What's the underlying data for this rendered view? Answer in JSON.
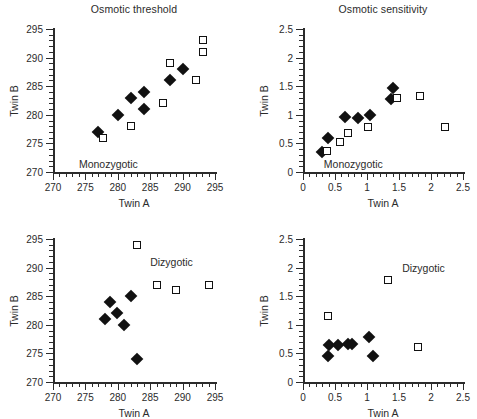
{
  "figure": {
    "panels": [
      {
        "id": "top-left",
        "title": "Osmotic threshold",
        "group_label": "Monozygotic",
        "xlabel": "Twin A",
        "ylabel": "Twin B",
        "xlim": [
          270,
          295
        ],
        "ylim": [
          270,
          295
        ],
        "xticks": [
          270,
          275,
          280,
          285,
          290,
          295
        ],
        "yticks": [
          270,
          275,
          280,
          285,
          290,
          295
        ],
        "xticklabels": [
          "270",
          "275",
          "280",
          "285",
          "290",
          "295"
        ],
        "yticklabels": [
          "270",
          "275",
          "280",
          "285",
          "290",
          "295"
        ],
        "minor_step": 1,
        "series": [
          {
            "name": "filled-diamond",
            "marker": "filled-diamond",
            "points": [
              [
                277.0,
                277.0
              ],
              [
                280.0,
                280.0
              ],
              [
                282.0,
                283.0
              ],
              [
                284.0,
                284.0
              ],
              [
                284.0,
                281.0
              ],
              [
                288.0,
                286.0
              ],
              [
                290.0,
                288.0
              ]
            ]
          },
          {
            "name": "open-square",
            "marker": "open-square",
            "points": [
              [
                277.7,
                276.0
              ],
              [
                282.0,
                278.0
              ],
              [
                287.0,
                282.0
              ],
              [
                288.0,
                289.0
              ],
              [
                292.0,
                286.0
              ],
              [
                293.2,
                291.0
              ],
              [
                293.2,
                293.0
              ]
            ]
          }
        ]
      },
      {
        "id": "top-right",
        "title": "Osmotic sensitivity",
        "group_label": "Monozygotic",
        "xlabel": "Twin A",
        "ylabel": "Twin B",
        "xlim": [
          0,
          2.5
        ],
        "ylim": [
          0,
          2.5
        ],
        "xticks": [
          0,
          0.5,
          1,
          1.5,
          2,
          2.5
        ],
        "yticks": [
          0,
          0.5,
          1,
          1.5,
          2,
          2.5
        ],
        "xticklabels": [
          "0",
          "0.5",
          "1",
          "1.5",
          "2",
          "2.5"
        ],
        "yticklabels": [
          "0",
          "0.5",
          "1",
          "1.5",
          "2",
          "2.5"
        ],
        "minor_step": 0.1,
        "series": [
          {
            "name": "filled-diamond",
            "marker": "filled-diamond",
            "points": [
              [
                0.29,
                0.35
              ],
              [
                0.39,
                0.6
              ],
              [
                0.66,
                0.97
              ],
              [
                0.86,
                0.95
              ],
              [
                1.05,
                1.0
              ],
              [
                1.37,
                1.28
              ],
              [
                1.4,
                1.47
              ]
            ]
          },
          {
            "name": "open-square",
            "marker": "open-square",
            "points": [
              [
                0.38,
                0.36
              ],
              [
                0.58,
                0.52
              ],
              [
                0.7,
                0.68
              ],
              [
                1.02,
                0.78
              ],
              [
                1.47,
                1.29
              ],
              [
                1.83,
                1.33
              ],
              [
                2.22,
                0.78
              ]
            ]
          }
        ]
      },
      {
        "id": "bottom-left",
        "title": "",
        "group_label": "Dizygotic",
        "xlabel": "Twin A",
        "ylabel": "Twin B",
        "xlim": [
          270,
          295
        ],
        "ylim": [
          270,
          295
        ],
        "xticks": [
          270,
          275,
          280,
          285,
          290,
          295
        ],
        "yticks": [
          270,
          275,
          280,
          285,
          290,
          295
        ],
        "xticklabels": [
          "270",
          "275",
          "280",
          "285",
          "290",
          "295"
        ],
        "yticklabels": [
          "270",
          "275",
          "280",
          "285",
          "290",
          "295"
        ],
        "minor_step": 1,
        "series": [
          {
            "name": "filled-diamond",
            "marker": "filled-diamond",
            "points": [
              [
                278.0,
                281.0
              ],
              [
                278.8,
                284.0
              ],
              [
                279.8,
                282.0
              ],
              [
                281.0,
                280.0
              ],
              [
                282.0,
                285.0
              ],
              [
                283.0,
                274.0
              ]
            ]
          },
          {
            "name": "open-square",
            "marker": "open-square",
            "points": [
              [
                283.0,
                294.0
              ],
              [
                286.0,
                287.0
              ],
              [
                289.0,
                286.0
              ],
              [
                294.0,
                287.0
              ]
            ]
          }
        ]
      },
      {
        "id": "bottom-right",
        "title": "",
        "group_label": "Dizygotic",
        "xlabel": "Twin A",
        "ylabel": "Twin B",
        "xlim": [
          0,
          2.5
        ],
        "ylim": [
          0,
          2.5
        ],
        "xticks": [
          0,
          0.5,
          1,
          1.5,
          2,
          2.5
        ],
        "yticks": [
          0,
          0.5,
          1,
          1.5,
          2,
          2.5
        ],
        "xticklabels": [
          "0",
          "0.5",
          "1",
          "1.5",
          "2",
          "2.5"
        ],
        "yticklabels": [
          "0",
          "0.5",
          "1",
          "1.5",
          "2",
          "2.5"
        ],
        "minor_step": 0.1,
        "series": [
          {
            "name": "filled-diamond",
            "marker": "filled-diamond",
            "points": [
              [
                0.39,
                0.46
              ],
              [
                0.4,
                0.64
              ],
              [
                0.55,
                0.65
              ],
              [
                0.7,
                0.67
              ],
              [
                0.76,
                0.67
              ],
              [
                1.03,
                0.78
              ],
              [
                1.1,
                0.46
              ]
            ]
          },
          {
            "name": "open-square",
            "marker": "open-square",
            "points": [
              [
                0.39,
                1.15
              ],
              [
                1.33,
                1.78
              ],
              [
                1.79,
                0.62
              ]
            ]
          }
        ]
      }
    ]
  },
  "chart_data": {
    "type": "scatter",
    "layout": {
      "rows": 2,
      "cols": 2,
      "column_titles": [
        "Osmotic threshold",
        "Osmotic sensitivity"
      ],
      "row_groups": [
        "Monozygotic",
        "Dizygotic"
      ],
      "grid": false,
      "legend": "none"
    },
    "panels": [
      {
        "panel": "top-left",
        "title": "Osmotic threshold",
        "group": "Monozygotic",
        "xlabel": "Twin A",
        "ylabel": "Twin B",
        "xlim": [
          270,
          295
        ],
        "ylim": [
          270,
          295
        ],
        "xticks": [
          270,
          275,
          280,
          285,
          290,
          295
        ],
        "yticks": [
          270,
          275,
          280,
          285,
          290,
          295
        ],
        "series": [
          {
            "name": "filled diamonds",
            "marker": "filled-diamond",
            "x": [
              277.0,
              280.0,
              282.0,
              284.0,
              284.0,
              288.0,
              290.0
            ],
            "y": [
              277.0,
              280.0,
              283.0,
              284.0,
              281.0,
              286.0,
              288.0
            ]
          },
          {
            "name": "open squares",
            "marker": "open-square",
            "x": [
              277.7,
              282.0,
              287.0,
              288.0,
              292.0,
              293.2,
              293.2
            ],
            "y": [
              276.0,
              278.0,
              282.0,
              289.0,
              286.0,
              291.0,
              293.0
            ]
          }
        ]
      },
      {
        "panel": "top-right",
        "title": "Osmotic sensitivity",
        "group": "Monozygotic",
        "xlabel": "Twin A",
        "ylabel": "Twin B",
        "xlim": [
          0,
          2.5
        ],
        "ylim": [
          0,
          2.5
        ],
        "xticks": [
          0,
          0.5,
          1,
          1.5,
          2,
          2.5
        ],
        "yticks": [
          0,
          0.5,
          1,
          1.5,
          2,
          2.5
        ],
        "series": [
          {
            "name": "filled diamonds",
            "marker": "filled-diamond",
            "x": [
              0.29,
              0.39,
              0.66,
              0.86,
              1.05,
              1.37,
              1.4
            ],
            "y": [
              0.35,
              0.6,
              0.97,
              0.95,
              1.0,
              1.28,
              1.47
            ]
          },
          {
            "name": "open squares",
            "marker": "open-square",
            "x": [
              0.38,
              0.58,
              0.7,
              1.02,
              1.47,
              1.83,
              2.22
            ],
            "y": [
              0.36,
              0.52,
              0.68,
              0.78,
              1.29,
              1.33,
              0.78
            ]
          }
        ]
      },
      {
        "panel": "bottom-left",
        "title": "",
        "group": "Dizygotic",
        "xlabel": "Twin A",
        "ylabel": "Twin B",
        "xlim": [
          270,
          295
        ],
        "ylim": [
          270,
          295
        ],
        "xticks": [
          270,
          275,
          280,
          285,
          290,
          295
        ],
        "yticks": [
          270,
          275,
          280,
          285,
          290,
          295
        ],
        "series": [
          {
            "name": "filled diamonds",
            "marker": "filled-diamond",
            "x": [
              278.0,
              278.8,
              279.8,
              281.0,
              282.0,
              283.0
            ],
            "y": [
              281.0,
              284.0,
              282.0,
              280.0,
              285.0,
              274.0
            ]
          },
          {
            "name": "open squares",
            "marker": "open-square",
            "x": [
              283.0,
              286.0,
              289.0,
              294.0
            ],
            "y": [
              294.0,
              287.0,
              286.0,
              287.0
            ]
          }
        ]
      },
      {
        "panel": "bottom-right",
        "title": "",
        "group": "Dizygotic",
        "xlabel": "Twin A",
        "ylabel": "Twin B",
        "xlim": [
          0,
          2.5
        ],
        "ylim": [
          0,
          2.5
        ],
        "xticks": [
          0,
          0.5,
          1,
          1.5,
          2,
          2.5
        ],
        "yticks": [
          0,
          0.5,
          1,
          1.5,
          2,
          2.5
        ],
        "series": [
          {
            "name": "filled diamonds",
            "marker": "filled-diamond",
            "x": [
              0.39,
              0.4,
              0.55,
              0.7,
              0.76,
              1.03,
              1.1
            ],
            "y": [
              0.46,
              0.64,
              0.65,
              0.67,
              0.67,
              0.78,
              0.46
            ]
          },
          {
            "name": "open squares",
            "marker": "open-square",
            "x": [
              0.39,
              1.33,
              1.79
            ],
            "y": [
              1.15,
              1.78,
              0.62
            ]
          }
        ]
      }
    ]
  }
}
